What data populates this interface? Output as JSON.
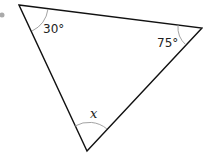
{
  "diagram": {
    "type": "triangle",
    "angles": [
      {
        "vertex": "top-left",
        "label": "30°"
      },
      {
        "vertex": "right",
        "label": "75°"
      },
      {
        "vertex": "bottom",
        "label": "x"
      }
    ],
    "colors": {
      "edge": "#111111",
      "arc": "#999999",
      "bullet": "#aaaaaa"
    }
  }
}
